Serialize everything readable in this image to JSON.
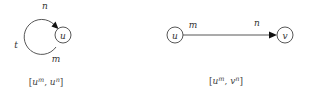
{
  "diagrams": [
    {
      "id": "loop",
      "node": "u",
      "labels": {
        "top": "n",
        "left": "t",
        "bottom": "m"
      },
      "caption": {
        "open": "[",
        "a_base": "u",
        "a_sup": "m",
        "sep": ", ",
        "b_base": "u",
        "b_sup": "n",
        "close": "]"
      }
    },
    {
      "id": "edge",
      "source": "u",
      "target": "v",
      "labels": {
        "source_end": "m",
        "target_end": "n"
      },
      "caption": {
        "open": "[",
        "a_base": "u",
        "a_sup": "m",
        "sep": ", ",
        "b_base": "v",
        "b_sup": "n",
        "close": "]"
      }
    }
  ]
}
